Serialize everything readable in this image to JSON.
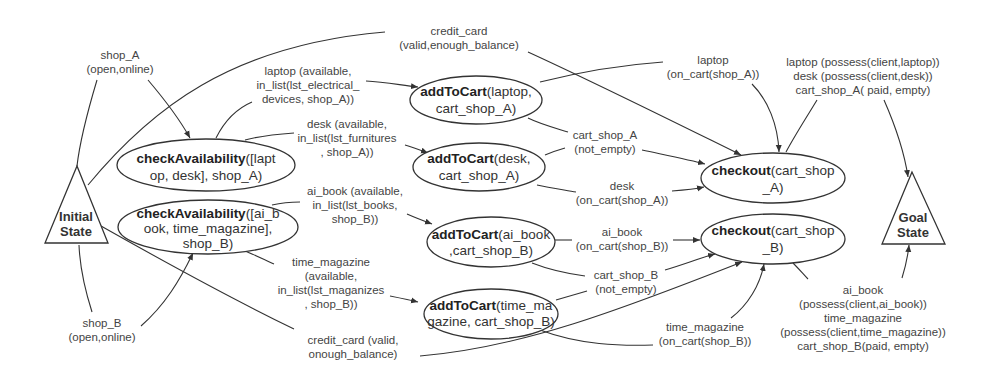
{
  "diagram": {
    "type": "planning-graph",
    "states": {
      "initial": {
        "line1": "Initial",
        "line2": "State"
      },
      "goal": {
        "line1": "Goal",
        "line2": "State"
      }
    },
    "actions": [
      {
        "id": "check_a",
        "bold": "checkAvailability",
        "rest1": "([lapt",
        "line2": "op, desk], shop_A)",
        "line3": ""
      },
      {
        "id": "check_b",
        "bold": "checkAvailability",
        "rest1": "([ai_b",
        "line2": "ook, time_magazine],",
        "line3": "shop_B)"
      },
      {
        "id": "add_laptop",
        "bold": "addToCart",
        "rest1": "(laptop,",
        "line2": "cart_shop_A)",
        "line3": ""
      },
      {
        "id": "add_desk",
        "bold": "addToCart",
        "rest1": "(desk,",
        "line2": "cart_shop_A)",
        "line3": ""
      },
      {
        "id": "add_aibook",
        "bold": "addToCart",
        "rest1": "(ai_book",
        "line2": ",cart_shop_B)",
        "line3": ""
      },
      {
        "id": "add_magazine",
        "bold": "addToCart",
        "rest1": "(time_ma",
        "line2": "gazine, cart_shop_B)",
        "line3": ""
      },
      {
        "id": "checkout_a",
        "bold": "checkout",
        "rest1": "(cart_shop",
        "line2": "_A)",
        "line3": ""
      },
      {
        "id": "checkout_b",
        "bold": "checkout",
        "rest1": "(cart_shop",
        "line2": "_B)",
        "line3": ""
      }
    ],
    "edge_labels": {
      "shop_a": [
        "shop_A",
        "(open,online)"
      ],
      "shop_b": [
        "shop_B",
        "(open,online)"
      ],
      "credit_top": [
        "credit_card",
        "(valid,enough_balance)"
      ],
      "credit_bottom": [
        "credit_card (valid,",
        "onough_balance)"
      ],
      "laptop_avail": [
        "laptop (available,",
        "in_list(lst_electrical_",
        "devices, shop_A))"
      ],
      "desk_avail": [
        "desk (available,",
        "in_list(lst_furnitures",
        ", shop_A))"
      ],
      "aibook_avail": [
        "ai_book (available,",
        "in_list(lst_books,",
        "shop_B))"
      ],
      "magazine_avail": [
        "time_magazine",
        "(available,",
        "in_list(lst_maganizes",
        ", shop_B))"
      ],
      "laptop_cart": [
        "laptop",
        "(on_cart(shop_A))"
      ],
      "cart_a_notempty": [
        "cart_shop_A",
        "(not_empty)"
      ],
      "desk_cart": [
        "desk",
        "(on_cart(shop_A))"
      ],
      "aibook_cart": [
        "ai_book",
        "(on_cart(shop_B))"
      ],
      "cart_b_notempty": [
        "cart_shop_B",
        "(not_empty)"
      ],
      "magazine_cart": [
        "time_magazine",
        "(on_cart(shop_B))"
      ],
      "goal_a": [
        "laptop (possess(client,laptop))",
        "desk (possess(client,desk))",
        "cart_shop_A( paid, empty)"
      ],
      "goal_b": [
        "ai_book",
        "(possess(client,ai_book))",
        "time_magazine",
        "(possess(client,time_magazine))",
        "cart_shop_B(paid, empty)"
      ]
    }
  }
}
